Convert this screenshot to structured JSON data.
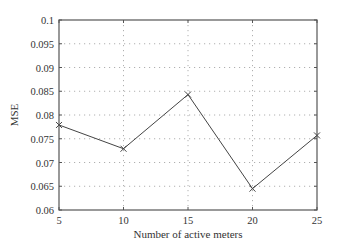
{
  "chart_data": {
    "type": "line",
    "title": "",
    "xlabel": "Number of active meters",
    "ylabel": "MSE",
    "x": [
      5,
      10,
      15,
      20,
      25
    ],
    "series": [
      {
        "name": "MSE",
        "values": [
          0.0779,
          0.0729,
          0.0843,
          0.0645,
          0.0757
        ],
        "marker": "x",
        "color": "#444444"
      }
    ],
    "xlim": [
      5,
      25
    ],
    "ylim": [
      0.06,
      0.1
    ],
    "xticks": [
      5,
      10,
      15,
      20,
      25
    ],
    "xtick_labels": [
      "5",
      "10",
      "15",
      "20",
      "25"
    ],
    "yticks": [
      0.06,
      0.065,
      0.07,
      0.075,
      0.08,
      0.085,
      0.09,
      0.095,
      0.1
    ],
    "ytick_labels": [
      "0.06",
      "0.065",
      "0.07",
      "0.075",
      "0.08",
      "0.085",
      "0.09",
      "0.095",
      "0.1"
    ],
    "grid": true,
    "grid_style": "dotted",
    "legend": null
  },
  "colors": {
    "axis": "#555555",
    "grid": "#b0b0b0",
    "line": "#444444",
    "text": "#333333"
  }
}
